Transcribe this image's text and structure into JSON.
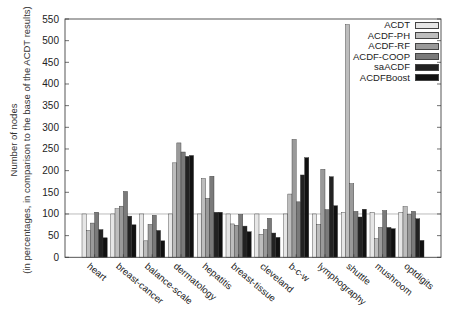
{
  "chart_data": {
    "type": "bar",
    "title": "",
    "xlabel": "",
    "ylabel": "Number of nodes",
    "ylabel_sub": "(in percentages, in comparison to the base of the ACDT results)",
    "ylim": [
      0,
      550
    ],
    "yticks": [
      0,
      50,
      100,
      150,
      200,
      250,
      300,
      350,
      400,
      450,
      500,
      550
    ],
    "grid": false,
    "reference_line": 100,
    "legend_position": "top-right",
    "categories": [
      "heart",
      "breast-cancer",
      "balance-scale",
      "dermatology",
      "hepatitis",
      "breast-tissue",
      "cleveland",
      "b-c-w",
      "lymphography",
      "shuttle",
      "mushroom",
      "optdigits"
    ],
    "series": [
      {
        "name": "ACDT",
        "color": "#e6e6e6",
        "values": [
          100,
          100,
          100,
          100,
          100,
          100,
          100,
          100,
          100,
          104,
          104,
          104
        ]
      },
      {
        "name": "ACDF-PH",
        "color": "#bdbdbd",
        "values": [
          62,
          112,
          38,
          218,
          182,
          77,
          53,
          146,
          76,
          537,
          43,
          117
        ]
      },
      {
        "name": "ACDF-RF",
        "color": "#9a9a9a",
        "values": [
          79,
          118,
          76,
          264,
          136,
          74,
          64,
          272,
          203,
          170,
          69,
          99
        ]
      },
      {
        "name": "ACDF-COOP",
        "color": "#7a7a7a",
        "values": [
          104,
          152,
          97,
          243,
          187,
          99,
          90,
          128,
          110,
          106,
          108,
          106
        ]
      },
      {
        "name": "saACDF",
        "color": "#222222",
        "values": [
          64,
          95,
          62,
          233,
          104,
          72,
          56,
          190,
          186,
          93,
          69,
          89
        ]
      },
      {
        "name": "ACDFBoost",
        "color": "#111111",
        "values": [
          45,
          75,
          38,
          235,
          104,
          59,
          46,
          230,
          119,
          111,
          66,
          39
        ]
      }
    ]
  }
}
